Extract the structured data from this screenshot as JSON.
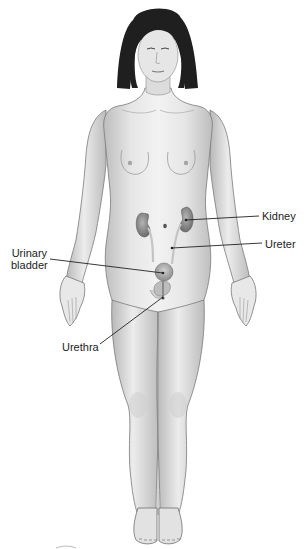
{
  "diagram": {
    "colors": {
      "background": "#ffffff",
      "skin_light": "#efefef",
      "skin_mid": "#d6d6d6",
      "skin_shadow": "#a8a8a8",
      "outline": "#777777",
      "hair": "#1e1e1e",
      "organ": "#8c8c8c",
      "organ_light": "#b9b9b9",
      "leader_line": "#222222",
      "label_text": "#222222"
    },
    "labels": [
      {
        "id": "kidney",
        "text": "Kidney",
        "x": 262,
        "y": 210,
        "line": {
          "x1": 186,
          "y1": 220,
          "x2": 259,
          "y2": 216
        }
      },
      {
        "id": "ureter",
        "text": "Ureter",
        "x": 265,
        "y": 238,
        "line": {
          "x1": 172,
          "y1": 248,
          "x2": 262,
          "y2": 243
        }
      },
      {
        "id": "urinary-bladder",
        "text_lines": [
          "Urinary",
          "bladder"
        ],
        "x": 11,
        "y": 247,
        "line": {
          "x1": 50,
          "y1": 259,
          "x2": 163,
          "y2": 273
        }
      },
      {
        "id": "urethra",
        "text": "Urethra",
        "x": 62,
        "y": 341,
        "line": {
          "x1": 100,
          "y1": 344,
          "x2": 163,
          "y2": 297
        }
      }
    ]
  }
}
